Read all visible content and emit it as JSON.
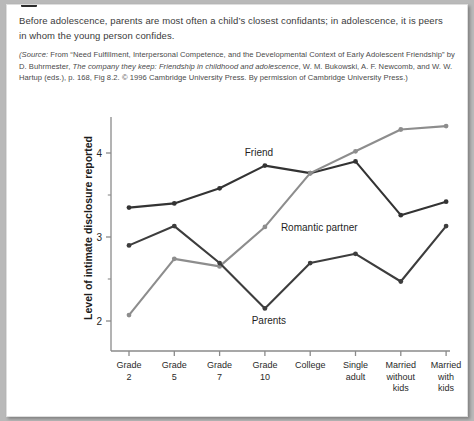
{
  "caption": {
    "text": "Before adolescence, parents are most often a child’s closest confidants; in adolescence, it is peers in whom the young person confides."
  },
  "source": {
    "prefix": "(Source:",
    "part1": " From “Need Fulfillment, Interpersonal Competence, and the Developmental Context of Early Adolescent Friendship” by D. Buhrmester, ",
    "italic1": "The company they keep: Friendship in childhood and adolescence",
    "part2": ", W. M. Bukowski, A. F. Newcomb, and W. W. Hartup (eds.), p. 168, Fig 8.2. © 1996 Cambridge University Press. By permission of Cambridge University Press.)"
  },
  "chart_data": {
    "type": "line",
    "title": "",
    "xlabel": "",
    "ylabel": "Level of intimate disclosure reported",
    "ylim": [
      1.72,
      4.55
    ],
    "yticks": [
      2,
      3,
      4
    ],
    "ytick_labels": [
      "2",
      "3",
      "4"
    ],
    "yminor_ticks": [
      2.5,
      3.5,
      4.5
    ],
    "grid": false,
    "legend": "inline-labels",
    "categories": [
      "Grade 2",
      "Grade 5",
      "Grade 7",
      "Grade 10",
      "College",
      "Single adult",
      "Married without kids",
      "Married with kids"
    ],
    "category_lines": [
      [
        "Grade",
        "2"
      ],
      [
        "Grade",
        "5"
      ],
      [
        "Grade",
        "7"
      ],
      [
        "Grade",
        "10"
      ],
      [
        "College"
      ],
      [
        "Single",
        "adult"
      ],
      [
        "Married",
        "without",
        "kids"
      ],
      [
        "Married",
        "with",
        "kids"
      ]
    ],
    "series": [
      {
        "name": "Friend",
        "color": "#333333",
        "label_x_index": 3,
        "values": [
          3.35,
          3.4,
          3.58,
          3.85,
          3.76,
          3.9,
          3.26,
          3.42
        ]
      },
      {
        "name": "Romantic partner",
        "color": "#8d8d8d",
        "label_x_index": 4,
        "values": [
          2.07,
          2.74,
          2.65,
          3.12,
          3.76,
          4.02,
          4.28,
          4.32
        ]
      },
      {
        "name": "Parents",
        "color": "#3d3d3d",
        "label_x_index": 3,
        "values": [
          2.9,
          3.13,
          2.69,
          2.15,
          2.69,
          2.8,
          2.47,
          3.13
        ]
      }
    ]
  },
  "colors": {
    "page_background": "#ffffff",
    "canvas_background": "#b9b9b9",
    "axis": "#8a8a8a",
    "text": "#3a3a3a",
    "friend": "#333333",
    "romantic": "#8d8d8d",
    "parents": "#3d3d3d"
  }
}
